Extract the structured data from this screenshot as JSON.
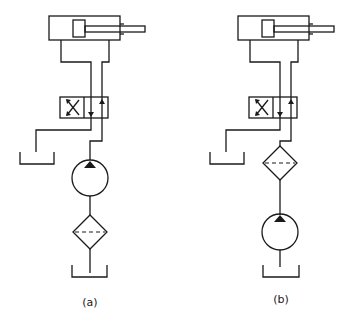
{
  "figure": {
    "type": "hydraulic-circuit-comparison",
    "circuits": [
      {
        "id": "a",
        "label": "(a)",
        "components_top_to_bottom": [
          "double-acting cylinder",
          "4/2 directional control valve",
          "hydraulic pump",
          "filter",
          "reservoir"
        ],
        "description": "Filter on pump suction line"
      },
      {
        "id": "b",
        "label": "(b)",
        "components_top_to_bottom": [
          "double-acting cylinder",
          "4/2 directional control valve",
          "filter",
          "hydraulic pump",
          "reservoir"
        ],
        "description": "Filter on pump pressure line"
      }
    ],
    "colors": {
      "ink": "#1a1a1a",
      "background": "#ffffff"
    }
  }
}
